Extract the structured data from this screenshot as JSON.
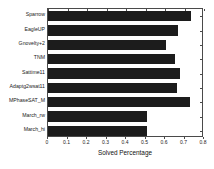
{
  "chart_data": {
    "type": "bar",
    "orientation": "horizontal",
    "title": "",
    "xlabel": "Solved Percentage",
    "ylabel": "",
    "xlim": [
      0,
      0.8
    ],
    "ylim": [
      0,
      9
    ],
    "grid": false,
    "legend": null,
    "xticks": [
      "0",
      "0.1",
      "0.2",
      "0.3",
      "0.4",
      "0.5",
      "0.6",
      "0.7",
      "0.8"
    ],
    "xtick_values": [
      0,
      0.1,
      0.2,
      0.3,
      0.4,
      0.5,
      0.6,
      0.7,
      0.8
    ],
    "categories": [
      "Sparrow",
      "EagleUP",
      "Gnovelty+2",
      "TNM",
      "Sattime11",
      "Adaptg2wsat11",
      "MPhaseSAT_M",
      "March_rw",
      "March_hi"
    ],
    "values": [
      0.735,
      0.665,
      0.605,
      0.652,
      0.675,
      0.663,
      0.73,
      0.51,
      0.51
    ],
    "bar_color": "#1c1c1c",
    "axis_color": "#4a4a4a",
    "background_color": "#ffffff"
  }
}
